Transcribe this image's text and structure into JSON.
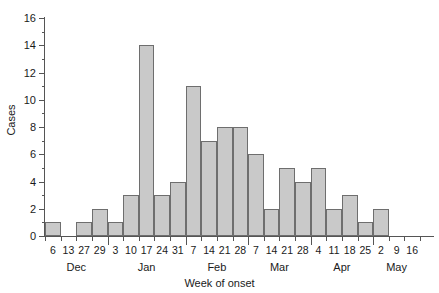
{
  "chart_data": {
    "type": "bar",
    "title": "",
    "xlabel": "Week of onset",
    "ylabel": "Cases",
    "ylim": [
      0,
      16
    ],
    "ytick_step": 2,
    "yticks": [
      0,
      2,
      4,
      6,
      8,
      10,
      12,
      14,
      16
    ],
    "minor_yticks": [
      1,
      3,
      5,
      7,
      9,
      11,
      13,
      15
    ],
    "grid": false,
    "legend": null,
    "bar_color": "#c9c9c9",
    "bar_edge_color": "#6e6e6e",
    "axis_color": "#555555",
    "categories": [
      "6",
      "13",
      "27",
      "29",
      "3",
      "10",
      "17",
      "24",
      "31",
      "7",
      "14",
      "21",
      "28",
      "7",
      "14",
      "21",
      "28",
      "4",
      "11",
      "18",
      "25",
      "2",
      "9",
      "16"
    ],
    "values": [
      1,
      0,
      1,
      2,
      1,
      3,
      14,
      3,
      4,
      11,
      7,
      8,
      8,
      6,
      2,
      5,
      4,
      5,
      2,
      3,
      1,
      2,
      0,
      0
    ],
    "months": [
      {
        "name": "Dec",
        "start_index": 0,
        "end_index": 3
      },
      {
        "name": "Jan",
        "start_index": 4,
        "end_index": 8
      },
      {
        "name": "Feb",
        "start_index": 9,
        "end_index": 12
      },
      {
        "name": "Mar",
        "start_index": 13,
        "end_index": 16
      },
      {
        "name": "Apr",
        "start_index": 17,
        "end_index": 20
      },
      {
        "name": "May",
        "start_index": 21,
        "end_index": 23
      }
    ],
    "month_boundaries_after_index": [
      3,
      8,
      12,
      16,
      20
    ]
  }
}
